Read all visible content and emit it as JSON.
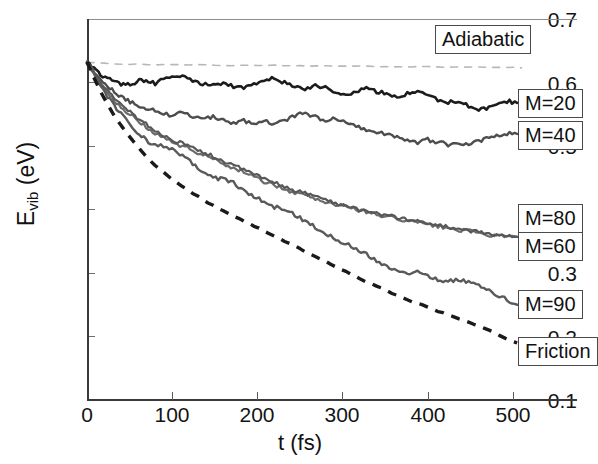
{
  "chart_data": {
    "type": "line",
    "title": "",
    "xlabel": "t (fs)",
    "ylabel": "E_vib (eV)",
    "ylabel_base": "E",
    "ylabel_sub": "vib",
    "ylabel_unit": " (eV)",
    "xlim": [
      0,
      577
    ],
    "ylim": [
      0.1,
      0.7
    ],
    "xticks": [
      0,
      100,
      200,
      300,
      400,
      500
    ],
    "yticks": [
      "0.1",
      "0.2",
      "0.3",
      "0.4",
      "0.5",
      "0.6",
      "0.7"
    ],
    "grid": false,
    "legend_position": "inline-callouts-right",
    "series": [
      {
        "name": "Adiabatic",
        "style": "dashed",
        "color": "#b8b8b8",
        "width": 1.6,
        "x": [
          0,
          20,
          40,
          60,
          80,
          100,
          130,
          160,
          190,
          220,
          250,
          280,
          310,
          340,
          370,
          400,
          430,
          460,
          490,
          510
        ],
        "y": [
          0.632,
          0.63,
          0.629,
          0.629,
          0.628,
          0.628,
          0.628,
          0.627,
          0.627,
          0.627,
          0.626,
          0.626,
          0.626,
          0.625,
          0.625,
          0.625,
          0.624,
          0.624,
          0.624,
          0.623
        ]
      },
      {
        "name": "M=20",
        "style": "solid",
        "color": "#1c1c1c",
        "width": 2.6,
        "x": [
          0,
          8,
          16,
          24,
          32,
          40,
          48,
          56,
          64,
          72,
          80,
          90,
          100,
          112,
          124,
          136,
          148,
          160,
          172,
          184,
          196,
          208,
          220,
          232,
          244,
          256,
          268,
          280,
          292,
          304,
          316,
          328,
          340,
          352,
          364,
          376,
          388,
          400,
          412,
          424,
          436,
          448,
          460,
          472,
          484,
          496,
          505
        ],
        "y": [
          0.632,
          0.622,
          0.612,
          0.606,
          0.602,
          0.598,
          0.596,
          0.6,
          0.604,
          0.602,
          0.598,
          0.606,
          0.612,
          0.61,
          0.603,
          0.598,
          0.596,
          0.6,
          0.594,
          0.591,
          0.596,
          0.604,
          0.606,
          0.6,
          0.594,
          0.59,
          0.596,
          0.592,
          0.586,
          0.582,
          0.586,
          0.59,
          0.586,
          0.582,
          0.578,
          0.582,
          0.586,
          0.58,
          0.572,
          0.568,
          0.572,
          0.562,
          0.556,
          0.56,
          0.566,
          0.57,
          0.568
        ]
      },
      {
        "name": "M=40",
        "style": "solid",
        "color": "#4d4d4d",
        "width": 2.4,
        "x": [
          0,
          8,
          16,
          24,
          32,
          40,
          48,
          56,
          64,
          72,
          80,
          90,
          100,
          112,
          124,
          136,
          148,
          160,
          172,
          184,
          196,
          208,
          220,
          232,
          244,
          256,
          268,
          280,
          292,
          304,
          316,
          328,
          340,
          352,
          364,
          376,
          388,
          400,
          412,
          424,
          436,
          448,
          460,
          472,
          484,
          496,
          505
        ],
        "y": [
          0.632,
          0.618,
          0.604,
          0.594,
          0.586,
          0.578,
          0.572,
          0.566,
          0.562,
          0.558,
          0.556,
          0.552,
          0.548,
          0.552,
          0.546,
          0.542,
          0.546,
          0.54,
          0.536,
          0.54,
          0.534,
          0.54,
          0.534,
          0.54,
          0.548,
          0.552,
          0.546,
          0.54,
          0.544,
          0.538,
          0.532,
          0.526,
          0.522,
          0.518,
          0.514,
          0.51,
          0.506,
          0.51,
          0.506,
          0.502,
          0.506,
          0.502,
          0.508,
          0.512,
          0.516,
          0.52,
          0.519
        ]
      },
      {
        "name": "M=80",
        "style": "solid",
        "color": "#6b6b6b",
        "width": 2.2,
        "x": [
          0,
          8,
          16,
          24,
          32,
          40,
          48,
          56,
          64,
          72,
          80,
          90,
          100,
          112,
          124,
          136,
          148,
          160,
          172,
          184,
          196,
          208,
          220,
          232,
          244,
          256,
          268,
          280,
          292,
          304,
          316,
          328,
          340,
          352,
          364,
          376,
          388,
          400,
          412,
          424,
          436,
          448,
          460,
          472,
          484,
          496,
          505
        ],
        "y": [
          0.632,
          0.614,
          0.598,
          0.584,
          0.572,
          0.562,
          0.552,
          0.544,
          0.536,
          0.528,
          0.52,
          0.512,
          0.506,
          0.5,
          0.494,
          0.486,
          0.48,
          0.472,
          0.466,
          0.46,
          0.452,
          0.444,
          0.438,
          0.432,
          0.426,
          0.424,
          0.418,
          0.412,
          0.408,
          0.404,
          0.4,
          0.396,
          0.392,
          0.388,
          0.386,
          0.382,
          0.38,
          0.376,
          0.374,
          0.37,
          0.368,
          0.366,
          0.362,
          0.36,
          0.358,
          0.357,
          0.357
        ]
      },
      {
        "name": "M=60",
        "style": "solid",
        "color": "#585858",
        "width": 2.2,
        "x": [
          0,
          8,
          16,
          24,
          32,
          40,
          48,
          56,
          64,
          72,
          80,
          90,
          100,
          112,
          124,
          136,
          148,
          160,
          172,
          184,
          196,
          208,
          220,
          232,
          244,
          256,
          268,
          280,
          292,
          304,
          316,
          328,
          340,
          352,
          364,
          376,
          388,
          400,
          412,
          424,
          436,
          448,
          460,
          472,
          484,
          496,
          505
        ],
        "y": [
          0.632,
          0.616,
          0.6,
          0.586,
          0.574,
          0.564,
          0.556,
          0.548,
          0.54,
          0.532,
          0.524,
          0.516,
          0.51,
          0.504,
          0.496,
          0.49,
          0.484,
          0.476,
          0.47,
          0.462,
          0.456,
          0.448,
          0.442,
          0.436,
          0.43,
          0.426,
          0.42,
          0.416,
          0.41,
          0.406,
          0.402,
          0.398,
          0.394,
          0.39,
          0.388,
          0.384,
          0.382,
          0.378,
          0.376,
          0.372,
          0.37,
          0.367,
          0.364,
          0.362,
          0.36,
          0.358,
          0.357
        ]
      },
      {
        "name": "M=90",
        "style": "solid",
        "color": "#5a5a5a",
        "width": 2.4,
        "x": [
          0,
          8,
          16,
          24,
          32,
          40,
          48,
          56,
          64,
          72,
          80,
          90,
          100,
          112,
          124,
          136,
          148,
          160,
          172,
          184,
          196,
          208,
          220,
          232,
          244,
          256,
          268,
          280,
          292,
          304,
          316,
          328,
          340,
          352,
          364,
          376,
          388,
          400,
          412,
          424,
          436,
          448,
          460,
          472,
          484,
          496,
          505
        ],
        "y": [
          0.632,
          0.612,
          0.594,
          0.578,
          0.564,
          0.55,
          0.538,
          0.526,
          0.516,
          0.506,
          0.5,
          0.5,
          0.494,
          0.484,
          0.472,
          0.46,
          0.45,
          0.448,
          0.442,
          0.43,
          0.42,
          0.412,
          0.404,
          0.4,
          0.392,
          0.382,
          0.372,
          0.362,
          0.354,
          0.346,
          0.338,
          0.33,
          0.32,
          0.31,
          0.304,
          0.3,
          0.302,
          0.296,
          0.29,
          0.286,
          0.29,
          0.286,
          0.28,
          0.272,
          0.264,
          0.256,
          0.25
        ]
      },
      {
        "name": "Friction",
        "style": "dashed-thick",
        "color": "#1a1a1a",
        "width": 3.4,
        "x": [
          0,
          8,
          16,
          24,
          32,
          40,
          48,
          56,
          64,
          72,
          80,
          90,
          100,
          112,
          124,
          136,
          148,
          160,
          172,
          184,
          196,
          208,
          220,
          232,
          244,
          256,
          268,
          280,
          292,
          304,
          316,
          328,
          340,
          352,
          364,
          376,
          388,
          400,
          412,
          424,
          436,
          448,
          460,
          472,
          484,
          496,
          505
        ],
        "y": [
          0.632,
          0.608,
          0.586,
          0.566,
          0.548,
          0.532,
          0.518,
          0.504,
          0.492,
          0.48,
          0.47,
          0.458,
          0.448,
          0.436,
          0.426,
          0.416,
          0.406,
          0.398,
          0.39,
          0.382,
          0.374,
          0.366,
          0.358,
          0.35,
          0.342,
          0.334,
          0.326,
          0.318,
          0.31,
          0.302,
          0.294,
          0.286,
          0.279,
          0.272,
          0.265,
          0.258,
          0.252,
          0.246,
          0.24,
          0.234,
          0.228,
          0.222,
          0.216,
          0.21,
          0.202,
          0.194,
          0.19
        ]
      }
    ],
    "callouts": [
      {
        "label": "Adiabatic",
        "name": "callout-adiabatic"
      },
      {
        "label": "M=20",
        "name": "callout-m20"
      },
      {
        "label": "M=40",
        "name": "callout-m40"
      },
      {
        "label": "M=80",
        "name": "callout-m80"
      },
      {
        "label": "M=60",
        "name": "callout-m60"
      },
      {
        "label": "M=90",
        "name": "callout-m90"
      },
      {
        "label": "Friction",
        "name": "callout-friction"
      }
    ]
  }
}
